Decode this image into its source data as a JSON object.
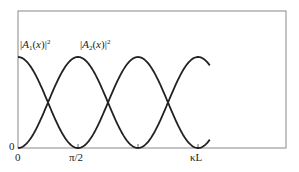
{
  "chart_data": {
    "type": "line",
    "title": "",
    "xlabel": "",
    "ylabel": "",
    "x_ticks": [
      {
        "label": "0",
        "value": 0
      },
      {
        "label": "π/2",
        "value": 1.5708
      },
      {
        "label": "",
        "value": 3.1416
      },
      {
        "label": "κL",
        "value": 4.712
      }
    ],
    "y_ticks": [
      {
        "label": "0",
        "value": 0
      }
    ],
    "xlim": [
      0,
      14.0
    ],
    "ylim": [
      0,
      1.5
    ],
    "grid": false,
    "legend": "inline labels above curves",
    "x_range_of_curves": [
      0,
      5.03
    ],
    "series": [
      {
        "name": "|A1(x)|^2",
        "label_html": "|A<sub>1</sub>(x)|<sup>2</sup>",
        "function": "cos^2(x)",
        "x": [
          0,
          0.785,
          1.571,
          2.356,
          3.142,
          3.927,
          4.712,
          5.03
        ],
        "values": [
          1,
          0.5,
          0,
          0.5,
          1,
          0.5,
          0,
          0.1
        ]
      },
      {
        "name": "|A2(x)|^2",
        "label_html": "|A<sub>2</sub>(x)|<sup>2</sup>",
        "function": "sin^2(x)",
        "x": [
          0,
          0.785,
          1.571,
          2.356,
          3.142,
          3.927,
          4.712,
          5.03
        ],
        "values": [
          0,
          0.5,
          1,
          0.5,
          0,
          0.5,
          1,
          0.9
        ]
      }
    ]
  },
  "labels": {
    "series1": "|A1(x)|²",
    "series2": "|A2(x)|²",
    "y_zero": "0",
    "x_zero": "0",
    "x_pi_half": "π/2",
    "x_kl": "κL"
  },
  "style": {
    "line_color": "#222222",
    "frame_color": "#777777"
  }
}
